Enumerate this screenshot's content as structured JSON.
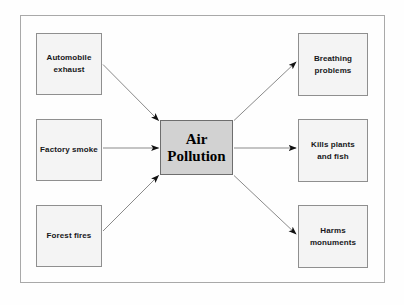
{
  "diagram": {
    "type": "cause-and-effect-flow",
    "colors": {
      "page_background": "#fefefe",
      "frame_border": "#a9a9a9",
      "node_fill": "#f4f4f4",
      "node_border": "#8f8f8f",
      "center_fill": "#d2d2d2",
      "center_border": "#6e6e6e",
      "arrow_line": "#8a8a8a",
      "arrow_head": "#111111",
      "text": "#17171a"
    },
    "center": {
      "id": "air-pollution",
      "label": "Air\nPollution"
    },
    "causes": [
      {
        "id": "automobile-exhaust",
        "label": "Automobile\nexhaust"
      },
      {
        "id": "factory-smoke",
        "label": "Factory smoke"
      },
      {
        "id": "forest-fires",
        "label": "Forest fires"
      }
    ],
    "effects": [
      {
        "id": "breathing-problems",
        "label": "Breathing\nproblems"
      },
      {
        "id": "kills-plants-fish",
        "label": "Kills plants\nand fish"
      },
      {
        "id": "harms-monuments",
        "label": "Harms\nmonuments"
      }
    ],
    "connectors": [
      {
        "id": "arrow-automobile-to-center",
        "from": "automobile-exhaust",
        "to": "air-pollution",
        "direction": "to-center"
      },
      {
        "id": "arrow-factory-to-center",
        "from": "factory-smoke",
        "to": "air-pollution",
        "direction": "to-center"
      },
      {
        "id": "arrow-forest-to-center",
        "from": "forest-fires",
        "to": "air-pollution",
        "direction": "to-center"
      },
      {
        "id": "arrow-center-to-breathing",
        "from": "air-pollution",
        "to": "breathing-problems",
        "direction": "from-center"
      },
      {
        "id": "arrow-center-to-kills",
        "from": "air-pollution",
        "to": "kills-plants-fish",
        "direction": "from-center"
      },
      {
        "id": "arrow-center-to-harms",
        "from": "air-pollution",
        "to": "harms-monuments",
        "direction": "from-center"
      }
    ]
  }
}
